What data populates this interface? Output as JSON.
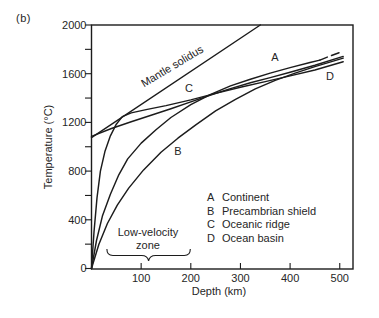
{
  "figure": {
    "panel_label": "(b)"
  },
  "axes": {
    "x": {
      "label": "Depth (km)",
      "ticks": [
        100,
        200,
        300,
        400,
        500
      ],
      "range": [
        0,
        527
      ]
    },
    "y": {
      "label": "Temperature (°C)",
      "ticks": [
        0,
        400,
        800,
        1200,
        1600,
        2000
      ],
      "minor_ticks": [
        200,
        600,
        1000,
        1400,
        1800
      ],
      "range": [
        0,
        2000
      ]
    }
  },
  "legend": {
    "items": [
      {
        "key": "A",
        "label": "Continent"
      },
      {
        "key": "B",
        "label": "Precambrian shield"
      },
      {
        "key": "C",
        "label": "Oceanic ridge"
      },
      {
        "key": "D",
        "label": "Ocean basin"
      }
    ]
  },
  "annotations": {
    "mantle_solidus_label": "Mantle solidus",
    "low_velocity_zone": {
      "line1": "Low-velocity",
      "line2": "zone",
      "span_km": [
        31,
        199
      ]
    },
    "curve_letters": [
      {
        "text": "A",
        "x_px": 275,
        "y_px": 57
      },
      {
        "text": "B",
        "x_px": 178,
        "y_px": 151
      },
      {
        "text": "C",
        "x_px": 189,
        "y_px": 88
      },
      {
        "text": "D",
        "x_px": 330,
        "y_px": 76
      }
    ]
  },
  "chart_data": {
    "type": "line",
    "title": "",
    "xlabel": "Depth (km)",
    "ylabel": "Temperature (°C)",
    "xlim": [
      0,
      527
    ],
    "ylim": [
      0,
      2000
    ],
    "grid": false,
    "legend_position": "inside lower right (text list, no box)",
    "series": [
      {
        "name": "Mantle solidus",
        "style": "solid",
        "points": [
          [
            0,
            1075
          ],
          [
            340,
            2000
          ]
        ]
      },
      {
        "name": "A Continent",
        "letter": "A",
        "style": "solid, dashed extrapolation after 460 km",
        "points": [
          [
            0,
            0
          ],
          [
            10,
            230
          ],
          [
            22,
            430
          ],
          [
            38,
            610
          ],
          [
            55,
            770
          ],
          [
            73,
            900
          ],
          [
            100,
            1030
          ],
          [
            130,
            1140
          ],
          [
            160,
            1240
          ],
          [
            200,
            1345
          ],
          [
            240,
            1430
          ],
          [
            280,
            1500
          ],
          [
            320,
            1555
          ],
          [
            360,
            1605
          ],
          [
            400,
            1650
          ],
          [
            440,
            1692
          ],
          [
            460,
            1712
          ]
        ],
        "dashed_tail": [
          [
            460,
            1712
          ],
          [
            482,
            1748
          ],
          [
            507,
            1785
          ]
        ]
      },
      {
        "name": "B Precambrian shield",
        "letter": "B",
        "style": "solid",
        "points": [
          [
            0,
            0
          ],
          [
            15,
            200
          ],
          [
            32,
            370
          ],
          [
            52,
            520
          ],
          [
            75,
            660
          ],
          [
            105,
            810
          ],
          [
            140,
            955
          ],
          [
            174,
            1070
          ],
          [
            210,
            1180
          ],
          [
            250,
            1295
          ],
          [
            290,
            1390
          ],
          [
            330,
            1475
          ],
          [
            370,
            1545
          ],
          [
            410,
            1605
          ],
          [
            450,
            1658
          ],
          [
            507,
            1728
          ]
        ]
      },
      {
        "name": "C Oceanic ridge",
        "letter": "C",
        "style": "solid",
        "points": [
          [
            0,
            1085
          ],
          [
            40,
            1150
          ],
          [
            80,
            1205
          ],
          [
            120,
            1258
          ],
          [
            160,
            1312
          ],
          [
            200,
            1368
          ],
          [
            240,
            1425
          ],
          [
            280,
            1478
          ],
          [
            320,
            1525
          ],
          [
            360,
            1568
          ],
          [
            400,
            1612
          ],
          [
            450,
            1670
          ],
          [
            507,
            1742
          ]
        ]
      },
      {
        "name": "D Ocean basin",
        "letter": "D",
        "style": "solid",
        "points": [
          [
            0,
            0
          ],
          [
            5,
            300
          ],
          [
            11,
            580
          ],
          [
            18,
            800
          ],
          [
            27,
            960
          ],
          [
            38,
            1090
          ],
          [
            50,
            1185
          ],
          [
            62,
            1248
          ],
          [
            80,
            1278
          ],
          [
            110,
            1305
          ],
          [
            150,
            1338
          ],
          [
            200,
            1385
          ],
          [
            250,
            1438
          ],
          [
            300,
            1488
          ],
          [
            350,
            1535
          ],
          [
            400,
            1582
          ],
          [
            450,
            1630
          ],
          [
            507,
            1698
          ]
        ]
      }
    ]
  },
  "colors": {
    "line": "#1c1c1c",
    "text": "#262626",
    "background": "#ffffff"
  }
}
